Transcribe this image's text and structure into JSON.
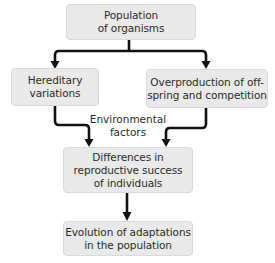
{
  "diagram": {
    "type": "flowchart",
    "nodes": [
      {
        "id": "population",
        "text": "Population\nof organisms"
      },
      {
        "id": "hereditary",
        "text": "Hereditary\nvariations"
      },
      {
        "id": "overproduction",
        "text": "Overproduction of off-\nspring and competition"
      },
      {
        "id": "differences",
        "text": "Differences in\nreproductive success\nof individuals"
      },
      {
        "id": "evolution",
        "text": "Evolution of adaptations\nin the population"
      }
    ],
    "labels": {
      "environmental": "Environmental\nfactors"
    },
    "edges": [
      {
        "from": "population",
        "to": "hereditary"
      },
      {
        "from": "population",
        "to": "overproduction"
      },
      {
        "from": "hereditary",
        "to": "differences"
      },
      {
        "from": "overproduction",
        "to": "differences"
      },
      {
        "from": "differences",
        "to": "evolution"
      }
    ],
    "colors": {
      "box_fill": "#e9e9e9",
      "box_border": "#dadada",
      "arrow": "#111111",
      "text": "#2b2b2b"
    }
  }
}
